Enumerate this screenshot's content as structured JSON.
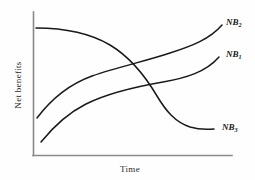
{
  "figure": {
    "background_color": "#fefefe",
    "axis_color": "#8a8a8a",
    "curve_color": "#1a1a1a"
  },
  "chart_data": {
    "type": "line",
    "title": "",
    "xlabel": "Time",
    "ylabel": "Net benefits",
    "grid": false,
    "legend_position": "inline-right-endpoints",
    "xlim": [
      0,
      100
    ],
    "ylim": [
      0,
      100
    ],
    "axis_ticks": {
      "x": [],
      "y": []
    },
    "series": [
      {
        "name": "NB1",
        "label_base": "NB",
        "label_sub": "1",
        "label_x": 226,
        "label_y": 57,
        "description": "Concave increasing curve rising from low-left, flattening through the middle, then rising again to the upper right",
        "x": [
          0,
          6,
          14,
          25,
          38,
          52,
          66,
          78,
          88,
          95,
          100
        ],
        "y": [
          26,
          37,
          48,
          57,
          63,
          67,
          70,
          73,
          77,
          83,
          89
        ]
      },
      {
        "name": "NB2",
        "label_base": "NB",
        "label_sub": "2",
        "label_x": 226,
        "label_y": 25,
        "description": "Sigmoid shaped curve: flat high at the left, decreasing steeply through the middle, crossing the other curves",
        "x": [
          0,
          8,
          18,
          30,
          42,
          52,
          62,
          72,
          82,
          92,
          100
        ],
        "y": [
          88,
          87,
          84,
          78,
          70,
          63,
          56,
          49,
          40,
          28,
          16
        ]
      },
      {
        "name": "NB3",
        "label_base": "NB",
        "label_sub": "3",
        "label_x": 222,
        "label_y": 130,
        "description": "Concave increasing curve starting lowest at the left, rising and flattening to a low plateau at the right",
        "x": [
          0,
          8,
          18,
          30,
          42,
          55,
          68,
          80,
          90,
          100
        ],
        "y": [
          9,
          22,
          34,
          44,
          51,
          56,
          60,
          63,
          65,
          66
        ]
      }
    ],
    "intersections": [
      {
        "between": [
          "NB2",
          "NB1"
        ],
        "x": 148,
        "y": 60
      },
      {
        "between": [
          "NB2",
          "NB3"
        ],
        "x": 164,
        "y": 82
      }
    ]
  }
}
